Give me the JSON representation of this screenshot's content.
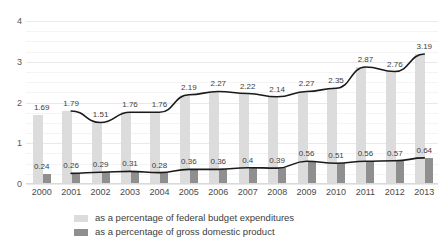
{
  "chart_data": {
    "type": "bar",
    "title": "",
    "subtitle": "",
    "xlabel": "",
    "ylabel": "",
    "ylim": [
      0,
      4
    ],
    "yticks": [
      "0",
      "1",
      "2",
      "3",
      "4"
    ],
    "grid": true,
    "legend_position": "bottom",
    "categories": [
      "2000",
      "2001",
      "2002",
      "2003",
      "2004",
      "2005",
      "2006",
      "2007",
      "2008",
      "2009",
      "2010",
      "2011",
      "2012",
      "2013"
    ],
    "series": [
      {
        "name": "as a percentage of federal budget expenditures",
        "render": "bar",
        "color": "#dcdcdc",
        "values": [
          1.69,
          1.79,
          1.51,
          1.76,
          1.76,
          2.19,
          2.27,
          2.22,
          2.14,
          2.27,
          2.35,
          2.87,
          2.76,
          3.19
        ],
        "labels": [
          "1.69",
          "1.79",
          "1.51",
          "1.76",
          "1.76",
          "2.19",
          "2.27",
          "2.22",
          "2.14",
          "2.27",
          "2.35",
          "2.87",
          "2.76",
          "3.19"
        ]
      },
      {
        "name": "as a percentage of gross domestic product",
        "render": "bar",
        "color": "#8f8f8f",
        "values": [
          0.24,
          0.26,
          0.29,
          0.31,
          0.28,
          0.36,
          0.36,
          0.4,
          0.39,
          0.56,
          0.51,
          0.56,
          0.57,
          0.64
        ],
        "labels": [
          "0.24",
          "0.26",
          "0.29",
          "0.31",
          "0.28",
          "0.36",
          "0.36",
          "0.4",
          "0.39",
          "0.56",
          "0.51",
          "0.56",
          "0.57",
          "0.64"
        ]
      }
    ],
    "trendlines": [
      {
        "name": "federal budget expenditures trend",
        "follows_series": 0,
        "color": "#1a1a1a",
        "start_index": 1
      },
      {
        "name": "gross domestic product trend",
        "follows_series": 1,
        "color": "#1a1a1a",
        "start_index": 1
      }
    ]
  },
  "legend": {
    "items": [
      {
        "label": "as a percentage of federal budget expenditures",
        "color": "#dcdcdc"
      },
      {
        "label": "as a percentage of gross domestic product",
        "color": "#8f8f8f"
      }
    ]
  }
}
